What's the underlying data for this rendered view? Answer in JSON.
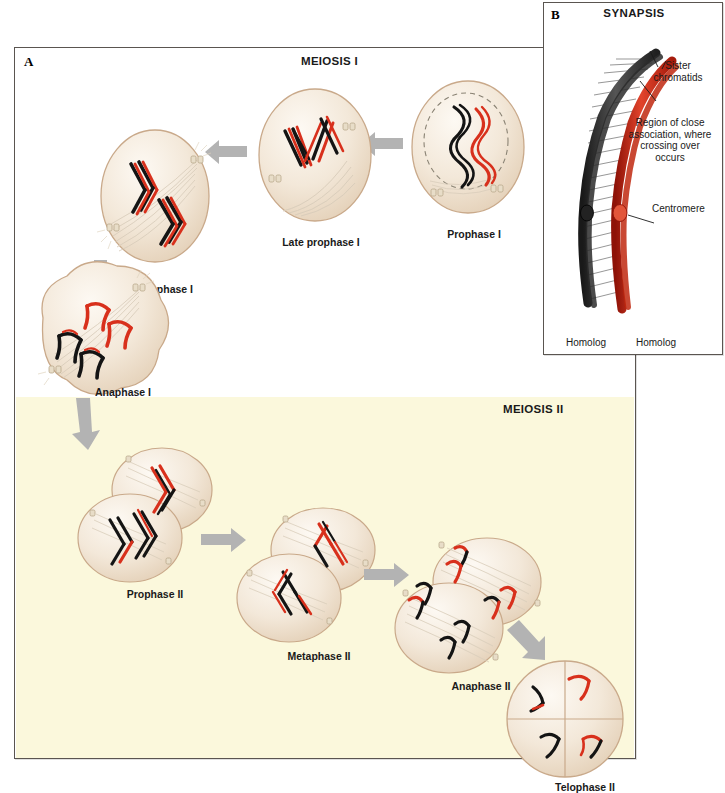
{
  "figure": {
    "panels": [
      {
        "letter": "A",
        "title": "MEIOSIS I",
        "subtitle": "MEIOSIS II"
      },
      {
        "letter": "B",
        "title": "SYNAPSIS"
      }
    ]
  },
  "panel_a": {
    "letter": "A",
    "meiosis1_title": "MEIOSIS I",
    "meiosis2_title": "MEIOSIS II",
    "stages": [
      {
        "id": "prophase-1",
        "label": "Prophase I",
        "phase": "I"
      },
      {
        "id": "late-prophase-1",
        "label": "Late prophase I",
        "phase": "I"
      },
      {
        "id": "metaphase-1",
        "label": "Metaphase I",
        "phase": "I"
      },
      {
        "id": "anaphase-1",
        "label": "Anaphase I",
        "phase": "I"
      },
      {
        "id": "prophase-2",
        "label": "Prophase II",
        "phase": "II"
      },
      {
        "id": "metaphase-2",
        "label": "Metaphase II",
        "phase": "II"
      },
      {
        "id": "anaphase-2",
        "label": "Anaphase II",
        "phase": "II"
      },
      {
        "id": "telophase-2",
        "label": "Telophase II",
        "phase": "II"
      }
    ]
  },
  "panel_b": {
    "letter": "B",
    "title": "SYNAPSIS",
    "callouts": [
      {
        "id": "sister-chromatids",
        "text": "Sister\nchromatids"
      },
      {
        "id": "region-close-association",
        "text": "Region of close\nassociation, where\ncrossing over\noccurs"
      },
      {
        "id": "centromere",
        "text": "Centromere"
      }
    ],
    "callout_lines": [
      {
        "id": "sister-chromatids-label",
        "line1": "Sister",
        "line2": "chromatids"
      },
      {
        "id": "crossing-over-label",
        "line1": "Region of close",
        "line2": "association, where",
        "line3": "crossing over",
        "line4": "occurs"
      },
      {
        "id": "centromere-label",
        "line1": "Centromere"
      }
    ],
    "footer": {
      "left": "Homolog",
      "right": "Homolog"
    }
  },
  "colors": {
    "page_background": "#ffffff",
    "panel_border": "#5a5550",
    "meiosis2_background": "#fbf8dc",
    "cell_fill": "#f5ece0",
    "cell_outline": "#c9a98a",
    "chromosome_red": "#d8301c",
    "chromosome_black": "#141414",
    "arrow_gray": "#b3b3b3",
    "spindle_fiber": "#d9cdbb",
    "homolog_dark": "#3a3a3a"
  }
}
